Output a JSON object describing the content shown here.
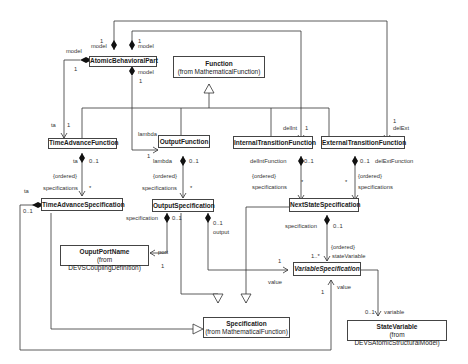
{
  "classes": {
    "atomic": {
      "name": "AtomicBehavioralPart"
    },
    "function": {
      "name": "Function",
      "from": "(from MathematicalFunction)"
    },
    "taf": {
      "name": "TimeAdvanceFunction"
    },
    "of": {
      "name": "OutputFunction"
    },
    "itf": {
      "name": "InternalTransitionFunction"
    },
    "etf": {
      "name": "ExternalTransitionFunction"
    },
    "tas": {
      "name": "TimeAdvanceSpecification"
    },
    "os": {
      "name": "OutputSpecification"
    },
    "nss": {
      "name": "NextStateSpecification"
    },
    "opn": {
      "name": "OuputPortName",
      "from": "(from DEVSCouplingDefinition)"
    },
    "vs": {
      "name": "VariableSpecification"
    },
    "spec": {
      "name": "Specification",
      "from": "(from MathematicalFunction)"
    },
    "sv": {
      "name": "StateVariable",
      "from": "(from DEVSAtomicStructuralModel)"
    }
  },
  "labels": {
    "model_left": "model",
    "one_left": "1",
    "model_top1": "model",
    "one_top1": "1",
    "model_top2": "model",
    "one_top2": "1",
    "model_bottom": "model",
    "one_bottom": "1",
    "ta_end": "ta",
    "ta_one": "1",
    "lambda_end": "lambda",
    "lambda_one": "1",
    "delint_end": "delInt",
    "delint_one": "1",
    "delext_one": "1",
    "delext_end": "delExt",
    "taf_ta": "ta",
    "taf_mult": "0..1",
    "taf_ordered": "{ordered}",
    "taf_specs": "specifications",
    "taf_star": "*",
    "of_lambda": "lambda",
    "of_mult": "0..1",
    "of_ordered": "{ordered}",
    "of_specs": "specifications",
    "of_star": "*",
    "itf_role": "delIntFunction",
    "itf_mult": "0..1",
    "itf_ordered": "{ordered}",
    "itf_specs": "specifications",
    "itf_star": "*",
    "etf_mult": "0..1",
    "etf_role": "delExtFunction",
    "etf_star": "*",
    "etf_ordered": "{ordered}",
    "etf_specs": "specifications",
    "tas_ta": "ta",
    "tas_mult": "0..1",
    "os_spec": "specification",
    "os_mult1": "0..1",
    "os_mult2": "0..1",
    "os_output": "output",
    "port": "port",
    "port_one": "1",
    "value_one": "1",
    "value1": "value",
    "nss_spec": "specification",
    "nss_mult": "0..1",
    "nss_ordered": "{ordered}",
    "state_var": "stateVariable",
    "state_mult": "1..*",
    "vs_one": "1",
    "vs_value": "value",
    "var_mult": "0..1",
    "variable": "variable"
  }
}
